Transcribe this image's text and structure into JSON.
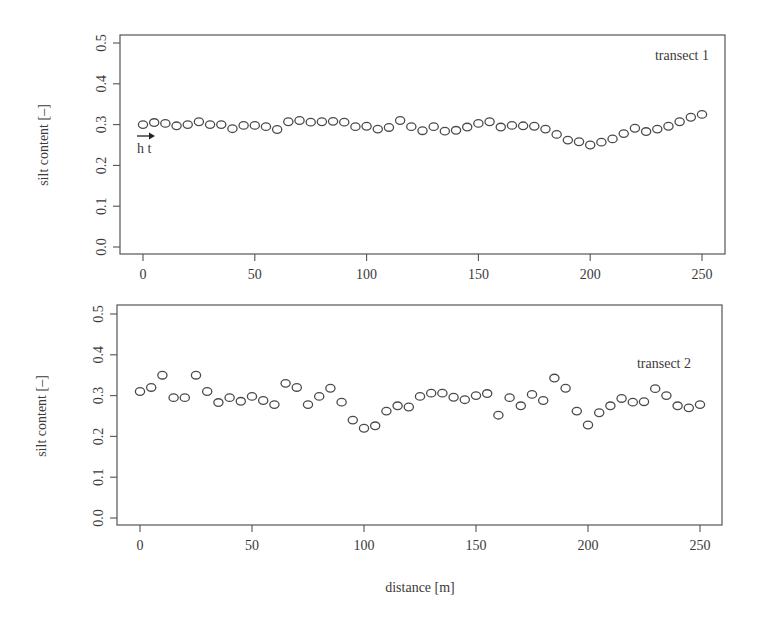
{
  "figure": {
    "xlabel": "distance [m]",
    "panels": [
      {
        "label": "transect 1",
        "ylabel": "silt content [–]",
        "annotation": "h t",
        "annotation_icon": "arrow-right-icon"
      },
      {
        "label": "transect 2",
        "ylabel": "silt content [–]"
      }
    ],
    "colors": {
      "frame": "#555555",
      "point": "#4a4a4a",
      "text": "#3a3a3a"
    }
  },
  "chart_data": [
    {
      "type": "scatter",
      "title": "transect 1",
      "xlabel": "",
      "ylabel": "silt content [–]",
      "xlim": [
        -10,
        262
      ],
      "ylim": [
        -0.02,
        0.52
      ],
      "xticks": [
        0,
        50,
        100,
        150,
        200,
        250
      ],
      "yticks": [
        0.0,
        0.1,
        0.2,
        0.3,
        0.4,
        0.5
      ],
      "ytick_labels": [
        "0.0",
        "0.1",
        "0.2",
        "0.3",
        "0.4",
        "0.5"
      ],
      "grid": false,
      "legend": "none",
      "annotations": [
        {
          "text": "h t",
          "x": 0,
          "y": 0.27,
          "arrow": "right"
        }
      ],
      "x": [
        0,
        5,
        10,
        15,
        20,
        25,
        30,
        35,
        40,
        45,
        50,
        55,
        60,
        65,
        70,
        75,
        80,
        85,
        90,
        95,
        100,
        105,
        110,
        115,
        120,
        125,
        130,
        135,
        140,
        145,
        150,
        155,
        160,
        165,
        170,
        175,
        180,
        185,
        190,
        195,
        200,
        205,
        210,
        215,
        220,
        225,
        230,
        235,
        240,
        245,
        250
      ],
      "values": [
        0.3,
        0.305,
        0.303,
        0.297,
        0.3,
        0.307,
        0.3,
        0.3,
        0.29,
        0.298,
        0.298,
        0.295,
        0.288,
        0.307,
        0.31,
        0.306,
        0.307,
        0.308,
        0.306,
        0.295,
        0.296,
        0.289,
        0.293,
        0.31,
        0.295,
        0.285,
        0.295,
        0.284,
        0.286,
        0.294,
        0.303,
        0.307,
        0.294,
        0.298,
        0.297,
        0.296,
        0.289,
        0.276,
        0.262,
        0.258,
        0.25,
        0.257,
        0.265,
        0.278,
        0.291,
        0.283,
        0.289,
        0.296,
        0.307,
        0.318,
        0.325
      ]
    },
    {
      "type": "scatter",
      "title": "transect 2",
      "xlabel": "distance [m]",
      "ylabel": "silt content [–]",
      "xlim": [
        -10,
        262
      ],
      "ylim": [
        -0.02,
        0.52
      ],
      "xticks": [
        0,
        50,
        100,
        150,
        200,
        250
      ],
      "yticks": [
        0.0,
        0.1,
        0.2,
        0.3,
        0.4,
        0.5
      ],
      "ytick_labels": [
        "0.0",
        "0.1",
        "0.2",
        "0.3",
        "0.4",
        "0.5"
      ],
      "grid": false,
      "legend": "none",
      "x": [
        0,
        5,
        10,
        15,
        20,
        25,
        30,
        35,
        40,
        45,
        50,
        55,
        60,
        65,
        70,
        75,
        80,
        85,
        90,
        95,
        100,
        105,
        110,
        115,
        120,
        125,
        130,
        135,
        140,
        145,
        150,
        155,
        160,
        165,
        170,
        175,
        180,
        185,
        190,
        195,
        200,
        205,
        210,
        215,
        220,
        225,
        230,
        235,
        240,
        245,
        250
      ],
      "values": [
        0.31,
        0.32,
        0.35,
        0.295,
        0.295,
        0.35,
        0.31,
        0.283,
        0.295,
        0.286,
        0.298,
        0.288,
        0.278,
        0.33,
        0.32,
        0.278,
        0.298,
        0.318,
        0.284,
        0.24,
        0.22,
        0.226,
        0.262,
        0.275,
        0.272,
        0.298,
        0.306,
        0.306,
        0.296,
        0.29,
        0.3,
        0.305,
        0.252,
        0.295,
        0.275,
        0.303,
        0.288,
        0.343,
        0.318,
        0.262,
        0.228,
        0.258,
        0.275,
        0.293,
        0.284,
        0.285,
        0.317,
        0.3,
        0.275,
        0.27,
        0.278
      ]
    }
  ]
}
